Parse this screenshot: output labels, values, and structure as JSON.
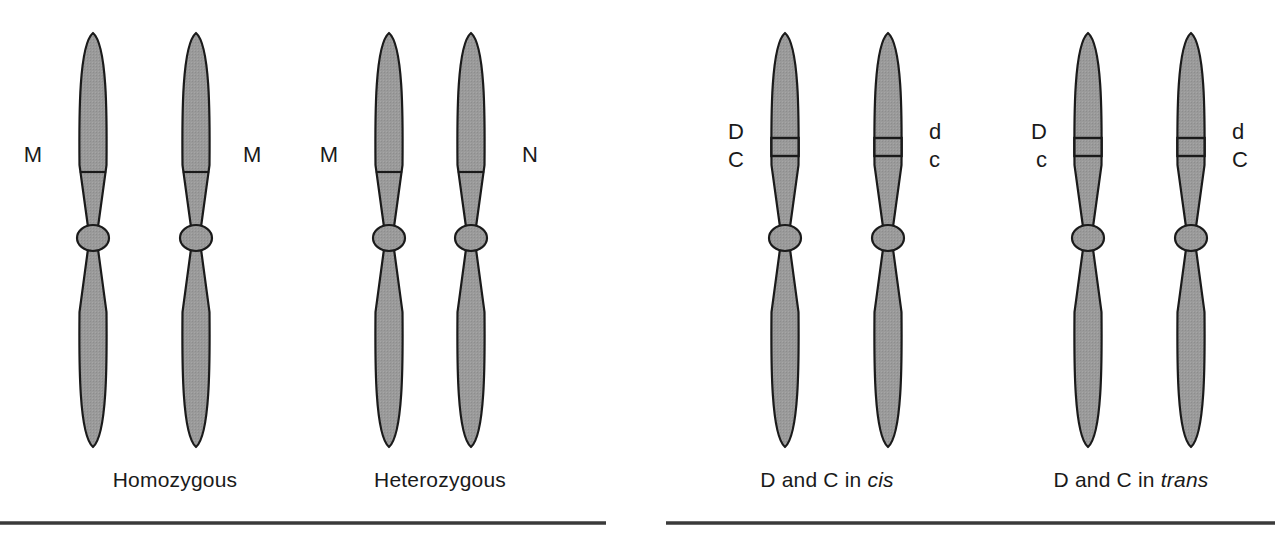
{
  "figure": {
    "width": 1275,
    "height": 541,
    "background": "#ffffff",
    "chromosome_fill": "#9a9a9a",
    "chromosome_stroke": "#1a1a1a",
    "band_fill": "#9a9a9a",
    "rule_color": "#3a3a3a",
    "text_color": "#1a1a1a"
  },
  "panels": [
    {
      "id": "homozygous",
      "caption": "Homozygous",
      "caption_italic_word": "",
      "caption_x": 175,
      "marker_type": "line",
      "chromosomes": [
        {
          "id": "homozygous-left",
          "cx": 93,
          "labels_side": "left",
          "label_x": 42,
          "alleles": [
            "M"
          ],
          "allele_y": [
            162
          ]
        },
        {
          "id": "homozygous-right",
          "cx": 196,
          "labels_side": "right",
          "label_x": 243,
          "alleles": [
            "M"
          ],
          "allele_y": [
            162
          ]
        }
      ]
    },
    {
      "id": "heterozygous",
      "caption": "Heterozygous",
      "caption_italic_word": "",
      "caption_x": 440,
      "marker_type": "line",
      "chromosomes": [
        {
          "id": "heterozygous-left",
          "cx": 389,
          "labels_side": "left",
          "label_x": 338,
          "alleles": [
            "M"
          ],
          "allele_y": [
            162
          ]
        },
        {
          "id": "heterozygous-right",
          "cx": 471,
          "labels_side": "right",
          "label_x": 522,
          "alleles": [
            "N"
          ],
          "allele_y": [
            162
          ]
        }
      ]
    },
    {
      "id": "cis",
      "caption": "D and C in ",
      "caption_italic_word": "cis",
      "caption_x": 827,
      "marker_type": "band",
      "chromosomes": [
        {
          "id": "cis-left",
          "cx": 785,
          "labels_side": "left",
          "label_x": 744,
          "alleles": [
            "D",
            "C"
          ],
          "allele_y": [
            139,
            167
          ]
        },
        {
          "id": "cis-right",
          "cx": 888,
          "labels_side": "right",
          "label_x": 929,
          "alleles": [
            "d",
            "c"
          ],
          "allele_y": [
            139,
            167
          ]
        }
      ]
    },
    {
      "id": "trans",
      "caption": "D and C in ",
      "caption_italic_word": "trans",
      "caption_x": 1131,
      "marker_type": "band",
      "chromosomes": [
        {
          "id": "trans-left",
          "cx": 1088,
          "labels_side": "left",
          "label_x": 1047,
          "alleles": [
            "D",
            "c"
          ],
          "allele_y": [
            139,
            167
          ]
        },
        {
          "id": "trans-right",
          "cx": 1191,
          "labels_side": "right",
          "label_x": 1232,
          "alleles": [
            "d",
            "C"
          ],
          "allele_y": [
            139,
            167
          ]
        }
      ]
    }
  ],
  "captions_y": 487,
  "rules": [
    {
      "id": "rule-left",
      "x1": 0,
      "x2": 606,
      "y": 523
    },
    {
      "id": "rule-right",
      "x1": 666,
      "x2": 1275,
      "y": 523
    }
  ]
}
